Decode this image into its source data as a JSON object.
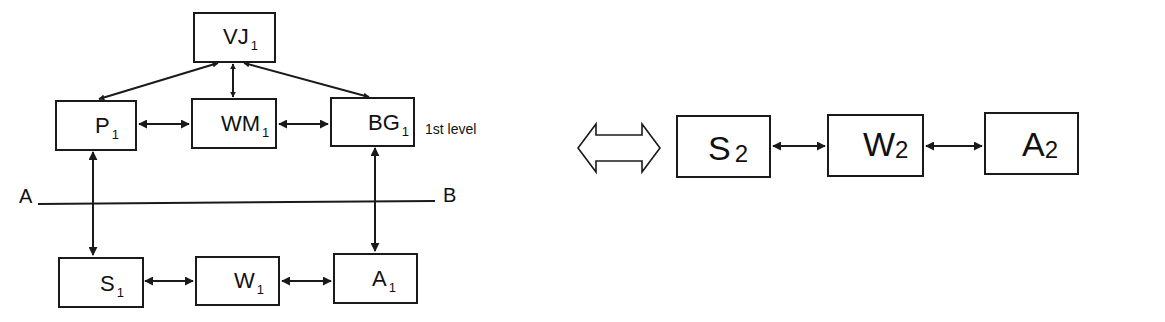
{
  "diagram": {
    "left": {
      "top_node": {
        "name": "VJ",
        "sub": "1"
      },
      "level1": [
        {
          "name": "P",
          "sub": "1"
        },
        {
          "name": "WM",
          "sub": "1"
        },
        {
          "name": "BG",
          "sub": "1"
        }
      ],
      "level1_label": "1st level",
      "divider": {
        "left_label": "A",
        "right_label": "B"
      },
      "level2": [
        {
          "name": "S",
          "sub": "1"
        },
        {
          "name": "W",
          "sub": "1"
        },
        {
          "name": "A",
          "sub": "1"
        }
      ]
    },
    "equivalence_symbol": "double-arrow",
    "right": {
      "nodes": [
        {
          "name": "S",
          "sub": "2"
        },
        {
          "name": "W",
          "sub": "2"
        },
        {
          "name": "A",
          "sub": "2"
        }
      ]
    },
    "edges": [
      {
        "from": "VJ1",
        "to": "P1",
        "type": "bidirectional"
      },
      {
        "from": "VJ1",
        "to": "WM1",
        "type": "bidirectional"
      },
      {
        "from": "VJ1",
        "to": "BG1",
        "type": "bidirectional"
      },
      {
        "from": "P1",
        "to": "WM1",
        "type": "bidirectional"
      },
      {
        "from": "WM1",
        "to": "BG1",
        "type": "bidirectional"
      },
      {
        "from": "P1",
        "to": "S1",
        "type": "bidirectional"
      },
      {
        "from": "BG1",
        "to": "A1",
        "type": "bidirectional"
      },
      {
        "from": "S1",
        "to": "W1",
        "type": "bidirectional"
      },
      {
        "from": "W1",
        "to": "A1",
        "type": "bidirectional"
      },
      {
        "from": "S2",
        "to": "W2",
        "type": "bidirectional"
      },
      {
        "from": "W2",
        "to": "A2",
        "type": "bidirectional"
      }
    ]
  }
}
